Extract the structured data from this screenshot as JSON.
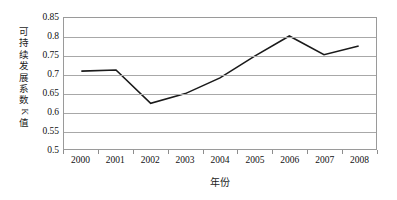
{
  "chart_data": {
    "type": "line",
    "title": "",
    "xlabel": "年份",
    "ylabel": "可持续发展系数K值",
    "ylabel_chars": [
      "可",
      "持",
      "续",
      "发",
      "展",
      "系",
      "数"
    ],
    "ylabel_rotated_char": "K",
    "ylabel_tail_char": "值",
    "categories": [
      "2000",
      "2001",
      "2002",
      "2003",
      "2004",
      "2005",
      "2006",
      "2007",
      "2008"
    ],
    "values": [
      0.708,
      0.711,
      0.622,
      0.648,
      0.69,
      0.748,
      0.802,
      0.752,
      0.775
    ],
    "ylim": [
      0.5,
      0.85
    ],
    "ytick_labels": [
      "0.85",
      "0.8",
      "0.75",
      "0.7",
      "0.65",
      "0.6",
      "0.55",
      "0.5"
    ],
    "ytick_values": [
      0.85,
      0.8,
      0.75,
      0.7,
      0.65,
      0.6,
      0.55,
      0.5
    ],
    "grid": true,
    "legend": "none",
    "series": [
      {
        "name": "可持续发展系数K值",
        "values": [
          0.708,
          0.711,
          0.622,
          0.648,
          0.69,
          0.748,
          0.802,
          0.752,
          0.775
        ],
        "color": "#1a1a1a"
      }
    ],
    "colors": {
      "line": "#1a1a1a",
      "grid": "#a8a8a8",
      "frame": "#9a9a9a",
      "text": "#111111",
      "background": "#ffffff"
    }
  }
}
